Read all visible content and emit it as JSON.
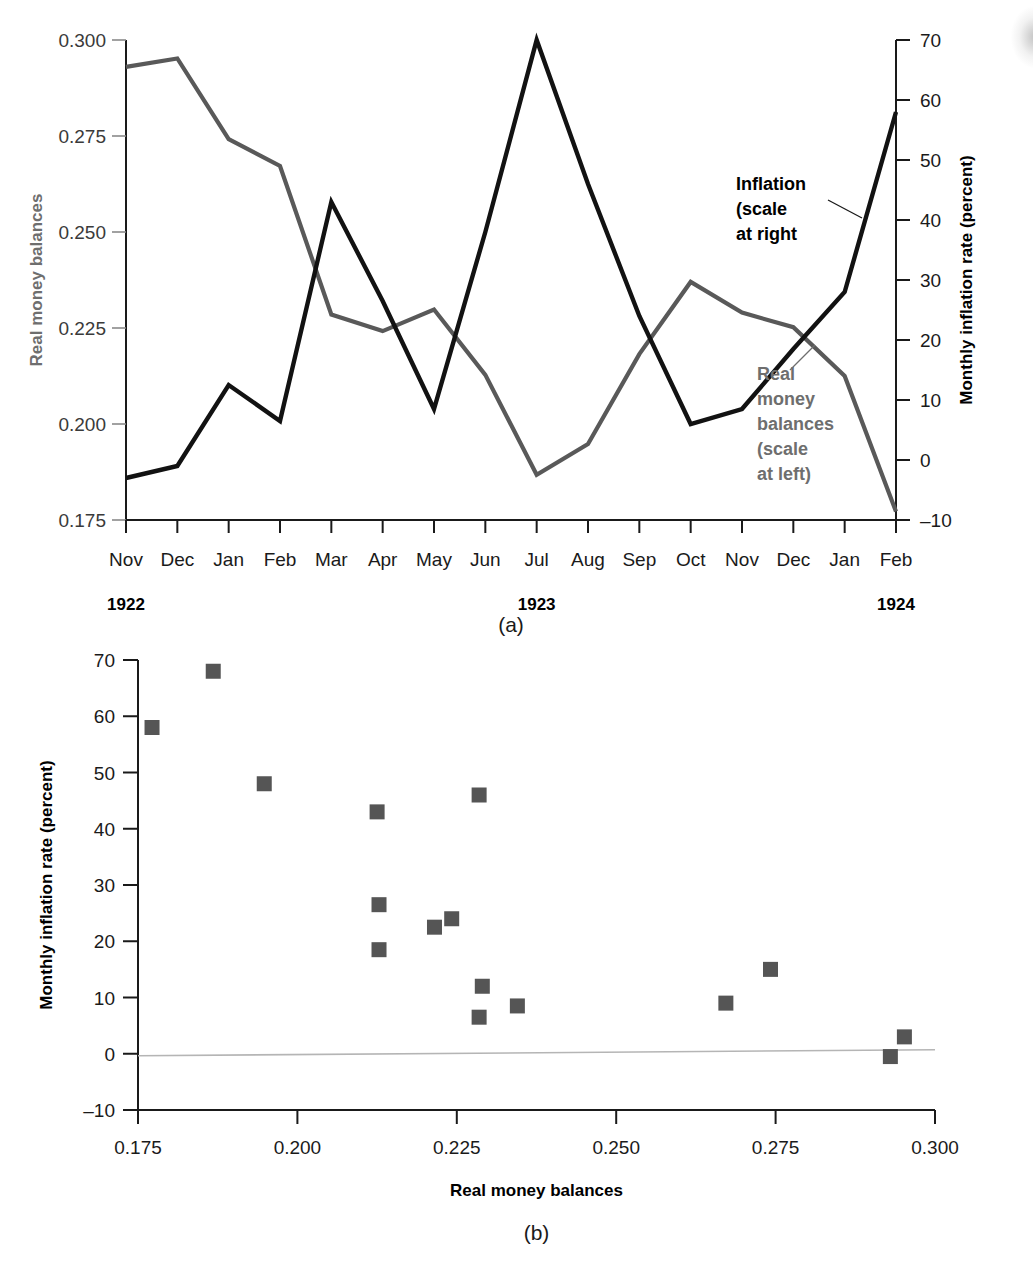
{
  "figure": {
    "panel_a_caption": "(a)",
    "panel_b_caption": "(b)"
  },
  "panel_a": {
    "left_axis_title": "Real money balances",
    "right_axis_title": "Monthly inflation rate (percent)",
    "left_ticks": [
      "0.300",
      "0.275",
      "0.250",
      "0.225",
      "0.200",
      "0.175"
    ],
    "right_ticks": [
      "70",
      "60",
      "50",
      "40",
      "30",
      "20",
      "10",
      "0",
      "–10"
    ],
    "months": [
      "Nov",
      "Dec",
      "Jan",
      "Feb",
      "Mar",
      "Apr",
      "May",
      "Jun",
      "Jul",
      "Aug",
      "Sep",
      "Oct",
      "Nov",
      "Dec",
      "Jan",
      "Feb"
    ],
    "years": [
      {
        "label": "1922",
        "at_month_index": 0
      },
      {
        "label": "1923",
        "at_month_index": 8
      },
      {
        "label": "1924",
        "at_month_index": 15
      }
    ],
    "annotations": [
      {
        "name": "inflation",
        "lines": [
          "Inflation",
          "(scale",
          "at right"
        ],
        "color": "#000000"
      },
      {
        "name": "real-money-balances",
        "lines": [
          "Real",
          "money",
          "balances",
          "(scale",
          "at left)"
        ],
        "color": "#6e6e6e"
      }
    ]
  },
  "panel_b": {
    "x_axis_title": "Real money balances",
    "y_axis_title": "Monthly inflation rate (percent)",
    "x_ticks": [
      "0.175",
      "0.200",
      "0.225",
      "0.250",
      "0.275",
      "0.300"
    ],
    "y_ticks": [
      "70",
      "60",
      "50",
      "40",
      "30",
      "20",
      "10",
      "0",
      "–10"
    ]
  },
  "colors": {
    "real_money_line": "#595959",
    "inflation_line": "#121212",
    "scatter_marker": "#555555",
    "axis": "#1a1a1a",
    "gray_text": "#6e6e6e"
  },
  "chart_data": [
    {
      "type": "line",
      "title": "(a) Real money balances and monthly inflation, Germany Nov 1922 – Feb 1924",
      "xlabel": "",
      "x": [
        "Nov 1922",
        "Dec 1922",
        "Jan 1923",
        "Feb 1923",
        "Mar 1923",
        "Apr 1923",
        "May 1923",
        "Jun 1923",
        "Jul 1923",
        "Aug 1923",
        "Sep 1923",
        "Oct 1923",
        "Nov 1923",
        "Dec 1923",
        "Jan 1924",
        "Feb 1924"
      ],
      "categories": [
        "Nov",
        "Dec",
        "Jan",
        "Feb",
        "Mar",
        "Apr",
        "May",
        "Jun",
        "Jul",
        "Aug",
        "Sep",
        "Oct",
        "Nov",
        "Dec",
        "Jan",
        "Feb"
      ],
      "grid": false,
      "legend": "in-plot annotations",
      "series": [
        {
          "name": "Real money balances (scale at left)",
          "axis": "left",
          "ylabel": "Real money balances",
          "ylim": [
            0.175,
            0.3
          ],
          "color": "#595959",
          "values": [
            0.293,
            0.2952,
            0.2742,
            0.2672,
            0.2285,
            0.2242,
            0.2298,
            0.2128,
            0.1868,
            0.1948,
            0.2182,
            0.237,
            0.229,
            0.2252,
            0.2125,
            0.1772
          ]
        },
        {
          "name": "Inflation (scale at right)",
          "axis": "right",
          "ylabel": "Monthly inflation rate (percent)",
          "ylim": [
            -10,
            70
          ],
          "color": "#121212",
          "values": [
            -3.0,
            -1.0,
            12.5,
            6.5,
            43.0,
            26.5,
            8.5,
            38.0,
            70.0,
            46.0,
            24.0,
            6.0,
            8.5,
            18.5,
            28.0,
            58.0
          ]
        }
      ]
    },
    {
      "type": "scatter",
      "title": "(b) Monthly inflation rate versus real money balances",
      "xlabel": "Real money balances",
      "ylabel": "Monthly inflation rate (percent)",
      "xlim": [
        0.175,
        0.3
      ],
      "ylim": [
        -10,
        70
      ],
      "grid": false,
      "marker": "square",
      "color": "#555555",
      "reference_line": {
        "name": "zero-line",
        "y": 0
      },
      "points": [
        {
          "x": 0.1772,
          "y": 58.0
        },
        {
          "x": 0.1868,
          "y": 68.0
        },
        {
          "x": 0.1948,
          "y": 48.0
        },
        {
          "x": 0.2125,
          "y": 43.0
        },
        {
          "x": 0.2128,
          "y": 26.5
        },
        {
          "x": 0.2128,
          "y": 18.5
        },
        {
          "x": 0.2215,
          "y": 22.5
        },
        {
          "x": 0.2242,
          "y": 24.0
        },
        {
          "x": 0.2285,
          "y": 46.0
        },
        {
          "x": 0.229,
          "y": 12.0
        },
        {
          "x": 0.2285,
          "y": 6.5
        },
        {
          "x": 0.2345,
          "y": 8.5
        },
        {
          "x": 0.2672,
          "y": 9.0
        },
        {
          "x": 0.2742,
          "y": 15.0
        },
        {
          "x": 0.293,
          "y": -0.5
        },
        {
          "x": 0.2952,
          "y": 3.0
        }
      ]
    }
  ]
}
